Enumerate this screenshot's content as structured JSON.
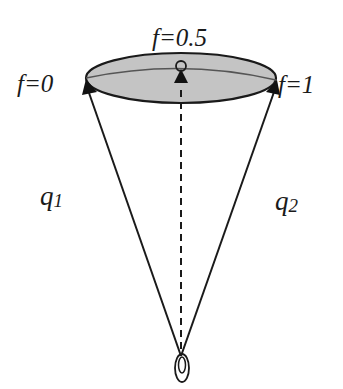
{
  "diagram": {
    "labels": {
      "f_left": "f=0",
      "f_mid": "f=0.5",
      "f_right": "f=1",
      "q1_base": "q",
      "q1_sub": "1",
      "q2_base": "q",
      "q2_sub": "2"
    },
    "colors": {
      "ellipse_fill": "#c4c4c4",
      "stroke": "#1a1a1a",
      "inner_curve": "#555555",
      "background": "#ffffff"
    }
  }
}
